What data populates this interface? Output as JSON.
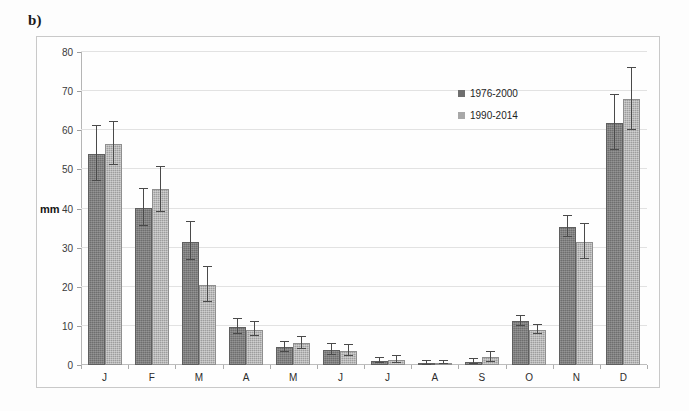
{
  "panel": {
    "label": "b)"
  },
  "chart_data": {
    "type": "bar",
    "title": "",
    "subtitle": "",
    "xlabel": "",
    "ylabel": "mm",
    "ylim": [
      0,
      80
    ],
    "ytick_step": 10,
    "yticks": [
      0,
      10,
      20,
      30,
      40,
      50,
      60,
      70,
      80
    ],
    "grid": true,
    "legend_position": "top-right",
    "categories": [
      "J",
      "F",
      "M",
      "A",
      "M",
      "J",
      "J",
      "A",
      "S",
      "O",
      "N",
      "D"
    ],
    "category_names": [
      "January",
      "February",
      "March",
      "April",
      "May",
      "June",
      "July",
      "August",
      "September",
      "October",
      "November",
      "December"
    ],
    "series": [
      {
        "name": "1976-2000",
        "color": "#6e6e6e",
        "values": [
          54.0,
          40.2,
          31.5,
          9.8,
          4.5,
          3.8,
          1.0,
          0.4,
          0.8,
          11.2,
          35.2,
          61.8
        ],
        "error_low": [
          47.0,
          35.5,
          26.8,
          8.0,
          3.2,
          2.6,
          0.4,
          0.1,
          0.3,
          10.0,
          32.6,
          55.0
        ],
        "error_high": [
          61.0,
          45.0,
          36.5,
          11.8,
          6.0,
          5.4,
          1.9,
          0.9,
          1.6,
          12.5,
          38.0,
          69.0
        ]
      },
      {
        "name": "1990-2014",
        "color": "#9d9d9d",
        "values": [
          56.6,
          45.0,
          20.5,
          9.0,
          5.6,
          3.5,
          1.3,
          0.5,
          2.0,
          9.0,
          31.5,
          68.0
        ],
        "error_low": [
          51.0,
          39.0,
          16.0,
          7.4,
          4.0,
          2.3,
          0.6,
          0.2,
          0.8,
          8.0,
          27.0,
          60.0
        ],
        "error_high": [
          62.0,
          50.5,
          25.0,
          11.0,
          7.2,
          5.0,
          2.2,
          1.1,
          3.3,
          10.2,
          36.0,
          76.0
        ]
      }
    ]
  },
  "legend": {
    "entries": [
      {
        "label": "1976-2000"
      },
      {
        "label": "1990-2014"
      }
    ]
  }
}
